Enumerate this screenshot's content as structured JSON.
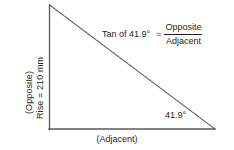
{
  "figure": {
    "background_color": "#ffffff",
    "line_color": "#58595b",
    "text_color": "#231f20"
  },
  "labels": {
    "opposite": "(Opposite)",
    "rise": "Rise = 210 mm",
    "adjacent": "(Adjacent)",
    "angle": "41.9°"
  },
  "equation": {
    "lhs": "Tan of 41.9°",
    "equals": "=",
    "numerator": "Opposite",
    "denominator": "Adjacent"
  },
  "geometry": {
    "apex": {
      "x": 49,
      "y": 5
    },
    "right_angle": {
      "x": 49,
      "y": 129
    },
    "base_right": {
      "x": 215,
      "y": 129
    },
    "angle_degrees": 41.9,
    "rise_mm": 210
  }
}
